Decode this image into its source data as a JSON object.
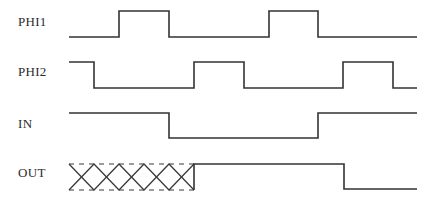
{
  "diagram": {
    "title": "",
    "type": "timing-diagram",
    "stroke_color": "#333333",
    "background": "#ffffff",
    "signals": [
      {
        "name": "PHI1",
        "label_y": 15,
        "high_y": 11,
        "low_y": 37,
        "points": [
          [
            69,
            37
          ],
          [
            119,
            37
          ],
          [
            119,
            11
          ],
          [
            169,
            11
          ],
          [
            169,
            37
          ],
          [
            269,
            37
          ],
          [
            269,
            11
          ],
          [
            318,
            11
          ],
          [
            318,
            37
          ],
          [
            417,
            37
          ]
        ]
      },
      {
        "name": "PHI2",
        "label_y": 65,
        "high_y": 62,
        "low_y": 88,
        "points": [
          [
            69,
            62
          ],
          [
            94,
            62
          ],
          [
            94,
            88
          ],
          [
            194,
            88
          ],
          [
            194,
            62
          ],
          [
            244,
            62
          ],
          [
            244,
            88
          ],
          [
            343,
            88
          ],
          [
            343,
            62
          ],
          [
            393,
            62
          ],
          [
            393,
            88
          ],
          [
            417,
            88
          ]
        ]
      },
      {
        "name": "IN",
        "label_y": 117,
        "high_y": 113,
        "low_y": 138,
        "points": [
          [
            69,
            113
          ],
          [
            169,
            113
          ],
          [
            169,
            138
          ],
          [
            318,
            138
          ],
          [
            318,
            113
          ],
          [
            417,
            113
          ]
        ]
      },
      {
        "name": "OUT",
        "label_y": 166,
        "high_y": 164,
        "low_y": 189,
        "undefined_region": {
          "x_start": 69,
          "x_end": 194,
          "top_y": 164,
          "bottom_y": 190,
          "vertices_x": [
            69,
            94,
            119,
            144,
            169,
            194
          ]
        },
        "points": [
          [
            194,
            190
          ],
          [
            194,
            164
          ],
          [
            344,
            164
          ],
          [
            344,
            189
          ],
          [
            417,
            189
          ]
        ]
      }
    ]
  }
}
